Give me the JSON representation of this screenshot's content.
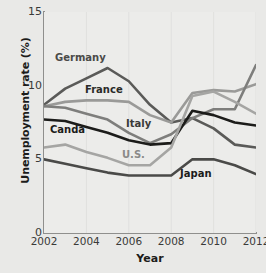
{
  "chart_data": {
    "type": "line",
    "title": "",
    "xlabel": "Year",
    "ylabel": "Unemployment rate (%)",
    "xlim": [
      2002,
      2012
    ],
    "ylim": [
      0,
      15
    ],
    "xticks": [
      "2002",
      "2004",
      "2006",
      "2008",
      "2010",
      "2012"
    ],
    "yticks": [
      "0",
      "5",
      "10",
      "15"
    ],
    "grid": "vertical-faint",
    "legend_position": "inline-labels",
    "x": [
      2002,
      2003,
      2004,
      2005,
      2006,
      2007,
      2008,
      2009,
      2010,
      2011,
      2012
    ],
    "series": [
      {
        "name": "Germany",
        "color": "#5a5a58",
        "values": [
          8.7,
          9.8,
          10.5,
          11.2,
          10.3,
          8.7,
          7.5,
          7.8,
          7.1,
          6.0,
          5.8
        ]
      },
      {
        "name": "France",
        "color": "#9a9a98",
        "values": [
          8.6,
          8.9,
          9.0,
          9.0,
          8.9,
          8.0,
          7.5,
          9.5,
          9.7,
          9.6,
          10.1
        ]
      },
      {
        "name": "Italy",
        "color": "#7e7e7c",
        "values": [
          8.6,
          8.5,
          8.1,
          7.7,
          6.8,
          6.1,
          6.7,
          7.8,
          8.4,
          8.4,
          11.4
        ]
      },
      {
        "name": "Canda",
        "color": "#1c1c1a",
        "values": [
          7.7,
          7.6,
          7.2,
          6.8,
          6.3,
          6.0,
          6.1,
          8.3,
          8.0,
          7.5,
          7.3
        ]
      },
      {
        "name": "U.S.",
        "color": "#a5a5a3",
        "values": [
          5.8,
          6.0,
          5.5,
          5.1,
          4.6,
          4.6,
          5.8,
          9.3,
          9.6,
          8.9,
          8.1
        ]
      },
      {
        "name": "Japan",
        "color": "#4a4a48",
        "values": [
          5.0,
          4.7,
          4.4,
          4.1,
          3.9,
          3.9,
          3.9,
          5.0,
          5.0,
          4.6,
          4.0
        ]
      }
    ],
    "series_labels": [
      {
        "name": "Germany",
        "text": "Germany",
        "color": "#4a4a48",
        "left": 55,
        "top": 52
      },
      {
        "name": "France",
        "text": "France",
        "color": "#2a2a28",
        "left": 85,
        "top": 84
      },
      {
        "name": "Italy",
        "text": "Italy",
        "color": "#3a3a38",
        "left": 126,
        "top": 118
      },
      {
        "name": "Canda",
        "text": "Canda",
        "color": "#1c1c1a",
        "left": 50,
        "top": 124
      },
      {
        "name": "U.S.",
        "text": "U.S.",
        "color": "#8a8a88",
        "left": 122,
        "top": 149
      },
      {
        "name": "Japan",
        "text": "Japan",
        "color": "#1c1c1a",
        "left": 180,
        "top": 168
      }
    ]
  }
}
